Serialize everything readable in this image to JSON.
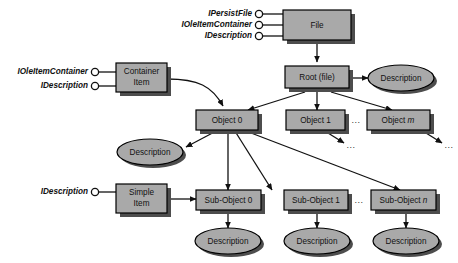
{
  "diagram": {
    "colors": {
      "box_fill": "#a9a9a9",
      "box_stroke": "#000000",
      "shadow": "#4d4d4d",
      "ellipse_fill": "#a9a9a9",
      "arrow": "#111111",
      "background": "#ffffff"
    },
    "interface_groups": [
      {
        "name": "file-interfaces",
        "target": "File",
        "labels": [
          "IPersistFile",
          "IOleItemContainer",
          "IDescription"
        ]
      },
      {
        "name": "container-item-interfaces",
        "target": "Container Item",
        "labels": [
          "IOleItemContainer",
          "IDescription"
        ]
      },
      {
        "name": "simple-item-interfaces",
        "target": "Simple Item",
        "labels": [
          "IDescription"
        ]
      }
    ],
    "boxes": [
      {
        "id": "file",
        "label": "File",
        "line2": ""
      },
      {
        "id": "container",
        "label": "Container",
        "line2": "Item"
      },
      {
        "id": "simple",
        "label": "Simple",
        "line2": "Item"
      },
      {
        "id": "root",
        "label": "Root (file)",
        "line2": ""
      },
      {
        "id": "object0",
        "label": "Object 0",
        "line2": ""
      },
      {
        "id": "object1",
        "label": "Object 1",
        "line2": ""
      },
      {
        "id": "objectm",
        "label": "Object ",
        "italic": "m"
      },
      {
        "id": "subobject0",
        "label": "Sub-Object 0",
        "line2": ""
      },
      {
        "id": "subobject1",
        "label": "Sub-Object 1",
        "line2": ""
      },
      {
        "id": "subobjectn",
        "label": "Sub-Object ",
        "italic": "n"
      }
    ],
    "ellipses": [
      {
        "id": "desc-root",
        "label": "Description"
      },
      {
        "id": "desc-obj0",
        "label": "Description"
      },
      {
        "id": "desc-sub0",
        "label": "Description"
      },
      {
        "id": "desc-sub1",
        "label": "Description"
      },
      {
        "id": "desc-subn",
        "label": "Description"
      }
    ],
    "ellipsis_markers": [
      {
        "id": "dots-object-row",
        "text": "..."
      },
      {
        "id": "dots-subobj-row",
        "text": "..."
      },
      {
        "id": "dots-after-obj1",
        "text": "..."
      },
      {
        "id": "dots-after-objm",
        "text": "..."
      }
    ]
  }
}
